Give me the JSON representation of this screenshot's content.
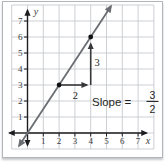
{
  "colors": {
    "background": "#ffffff",
    "frame_border": "#b2b6ba",
    "grid": "#c7cacf",
    "axis": "#1d1d1f",
    "tick_text": "#3a3a3c",
    "slope_line": "#6a6e72",
    "triangle_arrow": "#38383a",
    "point": "#111111",
    "annotation_text": "#1f1f21"
  },
  "chart_data": {
    "type": "line",
    "xlabel": "x",
    "ylabel": "y",
    "xlim": [
      -1,
      8
    ],
    "ylim": [
      -1,
      8
    ],
    "grid": true,
    "x_ticks": [
      "1",
      "2",
      "3",
      "4",
      "5",
      "6",
      "7"
    ],
    "y_ticks": [
      "1",
      "2",
      "3",
      "4",
      "5",
      "6",
      "7"
    ],
    "line": {
      "slope": 1.5,
      "intercept": 0,
      "x_extent": [
        -0.53,
        5.28
      ]
    },
    "points": [
      [
        2,
        3
      ],
      [
        4,
        6
      ]
    ],
    "slope_triangle": {
      "run": {
        "from": [
          2,
          3
        ],
        "to": [
          4,
          3
        ],
        "label": "2"
      },
      "rise": {
        "from": [
          4,
          3
        ],
        "to": [
          4,
          6
        ],
        "label": "3"
      }
    },
    "annotation": {
      "label": "Slope =",
      "numerator": "3",
      "denominator": "2"
    }
  }
}
